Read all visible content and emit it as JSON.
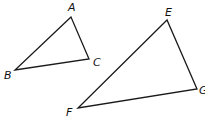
{
  "diagram": {
    "title": "",
    "triangles": [
      {
        "name": "ABC",
        "vertices": [
          {
            "label": "A",
            "x": 71,
            "y": 17,
            "lx": 68,
            "ly": 11
          },
          {
            "label": "B",
            "x": 15,
            "y": 70,
            "lx": 4,
            "ly": 79
          },
          {
            "label": "C",
            "x": 89,
            "y": 59,
            "lx": 93,
            "ly": 66
          }
        ]
      },
      {
        "name": "EFG",
        "vertices": [
          {
            "label": "E",
            "x": 167,
            "y": 20,
            "lx": 165,
            "ly": 16
          },
          {
            "label": "F",
            "x": 78,
            "y": 108,
            "lx": 66,
            "ly": 116
          },
          {
            "label": "G",
            "x": 197,
            "y": 89,
            "lx": 199,
            "ly": 94
          }
        ]
      }
    ],
    "stroke_color": "#1a1a1a",
    "background": "#ffffff"
  }
}
